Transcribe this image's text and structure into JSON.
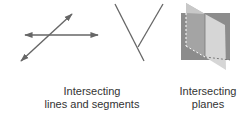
{
  "captions": {
    "lines": [
      "Intersecting",
      "lines and segments"
    ],
    "planes": [
      "Intersecting",
      "planes"
    ]
  },
  "colors": {
    "stroke": "#666666",
    "plane_back": "#8c8c8c",
    "plane_front": "#d0d0d0",
    "text": "#333333"
  },
  "figures": [
    {
      "name": "intersecting-lines",
      "description": "Two lines with arrowheads crossing"
    },
    {
      "name": "intersecting-segments",
      "description": "Two segments meeting in a V-like shape"
    },
    {
      "name": "intersecting-planes",
      "description": "Two planes intersecting along a line"
    }
  ]
}
